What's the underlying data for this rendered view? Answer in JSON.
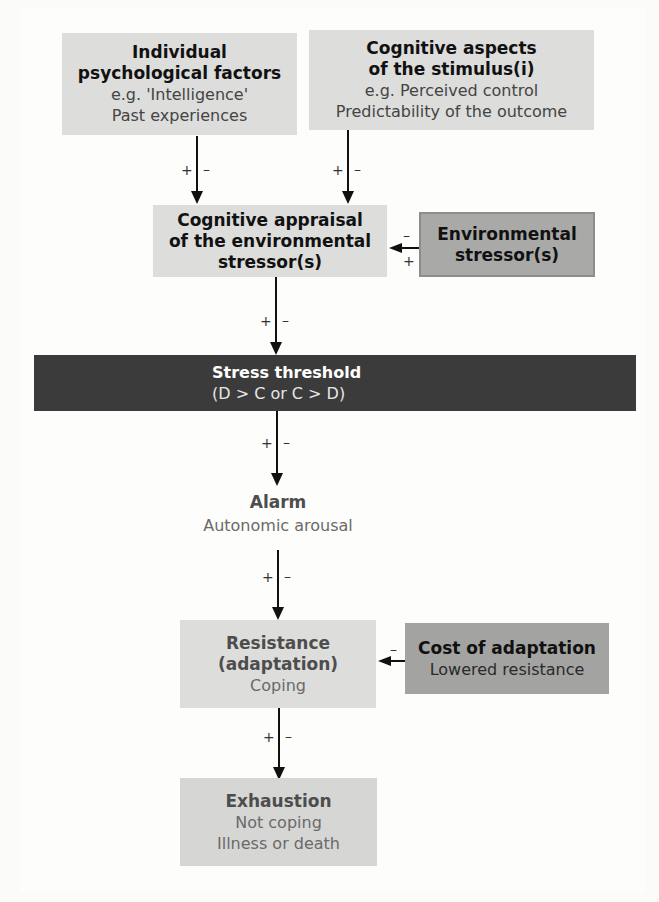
{
  "diagram": {
    "boxes": {
      "individual": {
        "title_line1": "Individual",
        "title_line2": "psychological factors",
        "sub_line1": "e.g. 'Intelligence'",
        "sub_line2": "Past experiences"
      },
      "cognitive_aspects": {
        "title_line1": "Cognitive aspects",
        "title_line2": "of the stimulus(i)",
        "sub_line1": "e.g. Perceived control",
        "sub_line2": "Predictability of the outcome"
      },
      "appraisal": {
        "title_line1": "Cognitive appraisal",
        "title_line2": "of the environmental",
        "title_line3": "stressor(s)"
      },
      "environmental": {
        "title_line1": "Environmental",
        "title_line2": "stressor(s)"
      },
      "threshold": {
        "title": "Stress threshold",
        "sub": "(D > C or C > D)"
      },
      "alarm": {
        "title": "Alarm",
        "sub": "Autonomic arousal"
      },
      "resistance": {
        "title_line1": "Resistance",
        "title_line2": "(adaptation)",
        "sub": "Coping"
      },
      "cost": {
        "title": "Cost of adaptation",
        "sub": "Lowered resistance"
      },
      "exhaustion": {
        "title": "Exhaustion",
        "sub_line1": "Not coping",
        "sub_line2": "Illness or death"
      }
    },
    "signs": {
      "plus": "+",
      "minus": "–"
    },
    "colors": {
      "light_box": "#dddddc",
      "mid_box": "#a9a9a8",
      "threshold_bar": "#3b3b3b",
      "arrow": "#111111"
    }
  }
}
